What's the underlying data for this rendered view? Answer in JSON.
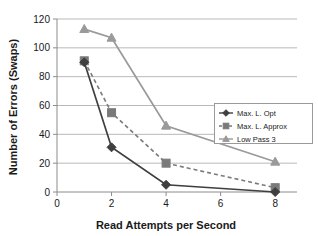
{
  "chart_data": {
    "type": "line",
    "title": "",
    "xlabel": "Read Attempts per Second",
    "ylabel": "Number of Errors (Swaps)",
    "x": [
      1,
      2,
      4,
      8
    ],
    "xlim": [
      0,
      8.8
    ],
    "ylim": [
      0,
      120
    ],
    "xticks": [
      "0",
      "2",
      "4",
      "6",
      "8"
    ],
    "xtick_values": [
      0,
      2,
      4,
      6,
      8
    ],
    "yticks": [
      "0",
      "20",
      "40",
      "60",
      "80",
      "100",
      "120"
    ],
    "ytick_values": [
      0,
      20,
      40,
      60,
      80,
      100,
      120
    ],
    "grid": "horizontal",
    "legend_position": "right-middle",
    "series": [
      {
        "name": "Max. L. Opt",
        "marker": "diamond",
        "linestyle": "solid",
        "color": "#3f3f3f",
        "values": [
          90,
          31,
          5,
          0
        ]
      },
      {
        "name": "Max. L. Approx",
        "marker": "square",
        "linestyle": "dashed",
        "color": "#7a7a7a",
        "values": [
          91,
          55,
          20,
          3
        ]
      },
      {
        "name": "Low Pass 3",
        "marker": "triangle",
        "linestyle": "solid",
        "color": "#9a9a9a",
        "values": [
          113,
          107,
          46,
          21
        ]
      }
    ]
  },
  "colors": {
    "grid": "#b9b9b9",
    "axis": "#8c8c8c",
    "text": "#1a1a1a",
    "legend_border": "#9a9a9a",
    "background": "#ffffff"
  }
}
